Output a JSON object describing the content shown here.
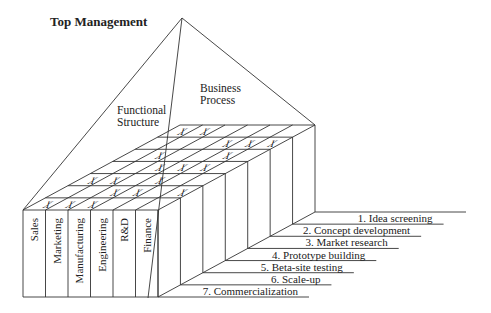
{
  "title": "Top Management",
  "pyramid_labels": {
    "left_face": [
      "Functional",
      "Structure"
    ],
    "right_face": [
      "Business",
      "Process"
    ]
  },
  "functions": [
    "Sales",
    "Marketing",
    "Manufacturing",
    "Engineering",
    "R&D",
    "Finance"
  ],
  "process_steps": [
    "1. Idea screening",
    "2. Concept development",
    "3. Market research",
    "4. Prototype building",
    "5. Beta-site testing",
    "6. Scale-up",
    "7. Commercialization"
  ],
  "matrix_marker": "X",
  "matrix": [
    {
      "step": 1,
      "functions": [
        1,
        2
      ]
    },
    {
      "step": 2,
      "functions": [
        4,
        5,
        6
      ]
    },
    {
      "step": 3,
      "functions": [
        2,
        5
      ]
    },
    {
      "step": 4,
      "functions": [
        3,
        4,
        5
      ]
    },
    {
      "step": 5,
      "functions": [
        1,
        2,
        4
      ]
    },
    {
      "step": 6,
      "functions": [
        3,
        4,
        6
      ]
    },
    {
      "step": 7,
      "functions": [
        1,
        2,
        3
      ]
    }
  ],
  "colors": {
    "line": "#333333",
    "text": "#222222",
    "background": "#ffffff"
  }
}
